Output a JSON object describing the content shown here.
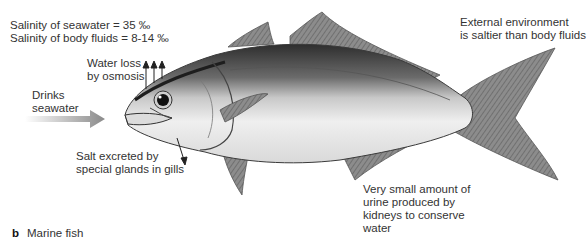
{
  "labels": {
    "salinity_seawater": "Salinity of seawater = 35 ‰",
    "salinity_body": "Salinity of body fluids = 8-14 ‰",
    "water_loss_1": "Water loss",
    "water_loss_2": "by osmosis",
    "drinks_1": "Drinks",
    "drinks_2": "seawater",
    "salt_1": "Salt excreted by",
    "salt_2": "special glands in gills",
    "external_1": "External environment",
    "external_2": "is saltier than body fluids",
    "urine_1": "Very small amount of",
    "urine_2": "urine produced by",
    "urine_3": "kidneys to conserve",
    "urine_4": "water"
  },
  "caption": {
    "letter": "b",
    "text": "Marine fish"
  },
  "colors": {
    "text": "#333333",
    "arrow_drink": "#8a8a8a",
    "fish_dark": "#3a3a3a",
    "fish_light": "#f2f2f2"
  }
}
